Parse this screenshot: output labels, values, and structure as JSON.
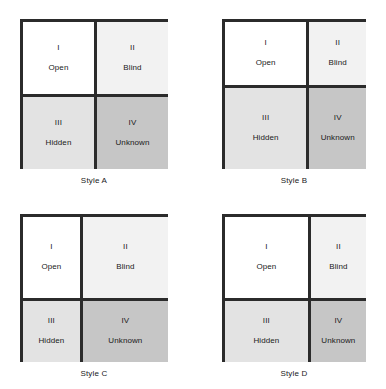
{
  "figure": {
    "quadrant_colors": {
      "open": "#ffffff",
      "blind": "#f2f2f2",
      "hidden": "#e3e3e3",
      "unknown": "#c6c6c6",
      "border": "#2b2b2b"
    },
    "quadrant_labels": {
      "open": {
        "numeral": "I",
        "term": "Open"
      },
      "blind": {
        "numeral": "II",
        "term": "Blind"
      },
      "hidden": {
        "numeral": "III",
        "term": "Hidden"
      },
      "unknown": {
        "numeral": "IV",
        "term": "Unknown"
      }
    },
    "panels": [
      {
        "id": "style-a",
        "caption": "Style A",
        "width_px": 148,
        "height_px": 150,
        "columns": "50% 50%",
        "rows": "50% 50%",
        "quadrants": [
          {
            "key": "open",
            "numeral": "I",
            "term": "Open",
            "color": "#ffffff"
          },
          {
            "key": "blind",
            "numeral": "II",
            "term": "Blind",
            "color": "#f2f2f2"
          },
          {
            "key": "hidden",
            "numeral": "III",
            "term": "Hidden",
            "color": "#e3e3e3"
          },
          {
            "key": "unknown",
            "numeral": "IV",
            "term": "Unknown",
            "color": "#c6c6c6"
          }
        ]
      },
      {
        "id": "style-b",
        "caption": "Style B",
        "width_px": 144,
        "height_px": 150,
        "columns": "59% 41%",
        "rows": "44% 56%",
        "quadrants": [
          {
            "key": "open",
            "numeral": "I",
            "term": "Open",
            "color": "#ffffff"
          },
          {
            "key": "blind",
            "numeral": "II",
            "term": "Blind",
            "color": "#f2f2f2"
          },
          {
            "key": "hidden",
            "numeral": "III",
            "term": "Hidden",
            "color": "#e3e3e3"
          },
          {
            "key": "unknown",
            "numeral": "IV",
            "term": "Unknown",
            "color": "#c6c6c6"
          }
        ]
      },
      {
        "id": "style-c",
        "caption": "Style C",
        "width_px": 148,
        "height_px": 148,
        "columns": "40% 60%",
        "rows": "57% 43%",
        "quadrants": [
          {
            "key": "open",
            "numeral": "I",
            "term": "Open",
            "color": "#ffffff"
          },
          {
            "key": "blind",
            "numeral": "II",
            "term": "Blind",
            "color": "#f2f2f2"
          },
          {
            "key": "hidden",
            "numeral": "III",
            "term": "Hidden",
            "color": "#e3e3e3"
          },
          {
            "key": "unknown",
            "numeral": "IV",
            "term": "Unknown",
            "color": "#c6c6c6"
          }
        ]
      },
      {
        "id": "style-d",
        "caption": "Style D",
        "width_px": 144,
        "height_px": 148,
        "columns": "60% 40%",
        "rows": "57% 43%",
        "quadrants": [
          {
            "key": "open",
            "numeral": "I",
            "term": "Open",
            "color": "#ffffff"
          },
          {
            "key": "blind",
            "numeral": "II",
            "term": "Blind",
            "color": "#f2f2f2"
          },
          {
            "key": "hidden",
            "numeral": "III",
            "term": "Hidden",
            "color": "#e3e3e3"
          },
          {
            "key": "unknown",
            "numeral": "IV",
            "term": "Unknown",
            "color": "#c6c6c6"
          }
        ]
      }
    ]
  }
}
